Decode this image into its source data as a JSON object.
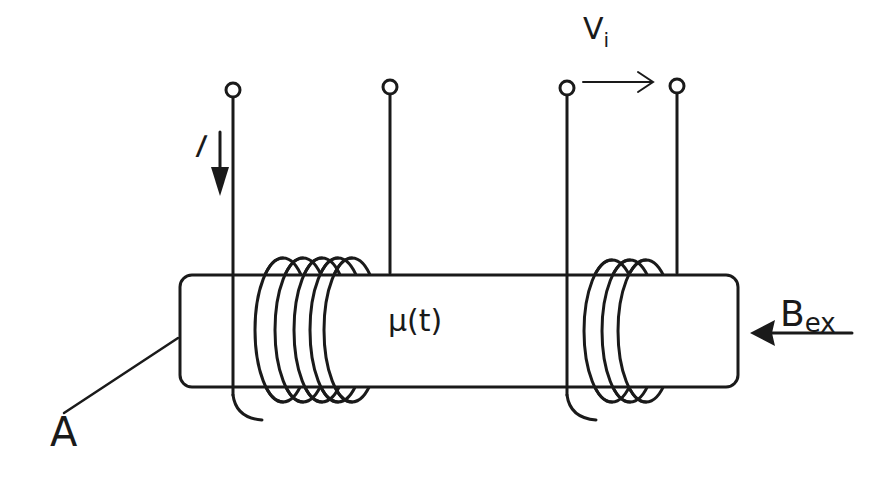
{
  "figure": {
    "type": "fluxgate magnetometer schematic",
    "labels": {
      "core_area": "A",
      "permeability": "μ(t)",
      "external_field_main": "B",
      "external_field_sub": "ex",
      "induced_voltage_main": "V",
      "induced_voltage_sub": "i",
      "excitation_current": "I"
    },
    "components": {
      "core": "ferromagnetic rod (rounded rectangle)",
      "excitation_coil": {
        "turns_visible": 5,
        "position": "left"
      },
      "pickup_coil": {
        "turns_visible": 3,
        "position": "right"
      },
      "terminals": 4
    },
    "colors": {
      "stroke": "#1a1a1a",
      "background": "#ffffff"
    },
    "caption": ""
  }
}
